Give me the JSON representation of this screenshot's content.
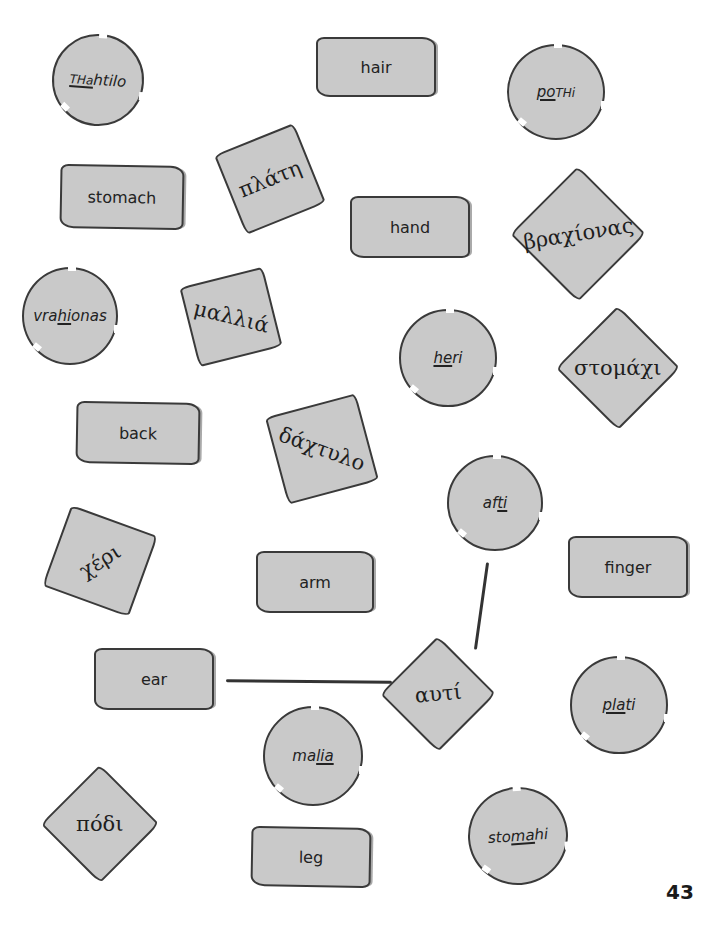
{
  "page": {
    "number": "43",
    "background": "#ffffff",
    "card_fill": "#c9c9c9",
    "outline_color": "#3a3a3a"
  },
  "transliterations": [
    {
      "id": "thahtilo",
      "pre": "",
      "under": "THa",
      "post": "htilo",
      "caps": true
    },
    {
      "id": "pothi",
      "pre": "",
      "under": "po",
      "post": "THi",
      "caps": true
    },
    {
      "id": "vrahionas",
      "pre": "vra",
      "under": "hi",
      "post": "onas"
    },
    {
      "id": "heri",
      "pre": "",
      "under": "he",
      "post": "ri"
    },
    {
      "id": "afti",
      "pre": "af",
      "under": "ti",
      "post": ""
    },
    {
      "id": "plati",
      "pre": "",
      "under": "pla",
      "post": "ti"
    },
    {
      "id": "malia",
      "pre": "ma",
      "under": "lia",
      "post": ""
    },
    {
      "id": "stomahi",
      "pre": "sto",
      "under": "ma",
      "post": "hi"
    }
  ],
  "english_words": [
    {
      "id": "hair",
      "label": "hair"
    },
    {
      "id": "stomach",
      "label": "stomach"
    },
    {
      "id": "hand",
      "label": "hand"
    },
    {
      "id": "back",
      "label": "back"
    },
    {
      "id": "finger",
      "label": "finger"
    },
    {
      "id": "arm",
      "label": "arm"
    },
    {
      "id": "ear",
      "label": "ear"
    },
    {
      "id": "leg",
      "label": "leg"
    }
  ],
  "greek_words": [
    {
      "id": "plati",
      "label": "πλάτη"
    },
    {
      "id": "vrahionas",
      "label": "βραχίονας"
    },
    {
      "id": "malia",
      "label": "μαλλιά"
    },
    {
      "id": "stomahi",
      "label": "στομάχι"
    },
    {
      "id": "dahtilo",
      "label": "δάχτυλο"
    },
    {
      "id": "heri",
      "label": "χέρι"
    },
    {
      "id": "afti",
      "label": "αυτί"
    },
    {
      "id": "podi",
      "label": "πόδι"
    }
  ],
  "example_connections": [
    {
      "from": "ear",
      "to": "αυτί"
    },
    {
      "from": "αυτί",
      "to": "afti"
    }
  ]
}
